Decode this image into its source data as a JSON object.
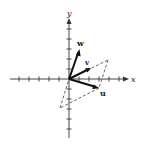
{
  "figure": {
    "axes": {
      "x_label": "x",
      "y_label": "y",
      "tick_spacing_px": 10,
      "origin_px": [
        69,
        79
      ]
    },
    "vectors": [
      {
        "name": "u",
        "label": "u",
        "tip_units": [
          3,
          -1
        ]
      },
      {
        "name": "v",
        "label": "v",
        "tip_units": [
          2,
          1
        ]
      },
      {
        "name": "w",
        "label": "w",
        "tip_units": [
          1,
          3
        ]
      }
    ],
    "parallelogram": {
      "style": "dashed",
      "vertices_px": [
        [
          69,
          79
        ],
        [
          108,
          60
        ],
        [
          99,
          88
        ],
        [
          60,
          108
        ]
      ]
    },
    "colors": {
      "axis": "#444444",
      "vector": "#111111",
      "dashed": "#555555",
      "background": "#ffffff"
    }
  }
}
